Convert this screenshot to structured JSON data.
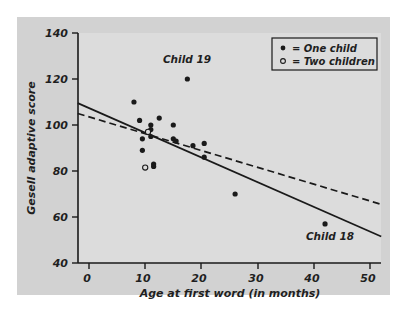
{
  "chart_data": {
    "type": "scatter",
    "title": "",
    "xlabel": "Age at first word (in months)",
    "ylabel": "Gesell adaptive score",
    "xlim": [
      -2,
      52
    ],
    "ylim": [
      40,
      140
    ],
    "xticks": [
      0,
      10,
      20,
      30,
      40,
      50
    ],
    "yticks": [
      40,
      60,
      80,
      100,
      120,
      140
    ],
    "grid": false,
    "legend_position": "top-right",
    "legend": [
      {
        "marker": "filled-dot",
        "label": "= One child"
      },
      {
        "marker": "open-circle",
        "label": "= Two children"
      }
    ],
    "series": [
      {
        "name": "One child",
        "marker": "filled-dot",
        "points": [
          {
            "x": 8,
            "y": 110
          },
          {
            "x": 9,
            "y": 102
          },
          {
            "x": 9.5,
            "y": 94
          },
          {
            "x": 9.5,
            "y": 89
          },
          {
            "x": 11,
            "y": 100
          },
          {
            "x": 11,
            "y": 98
          },
          {
            "x": 11,
            "y": 95
          },
          {
            "x": 11.5,
            "y": 83
          },
          {
            "x": 11.5,
            "y": 82
          },
          {
            "x": 12.5,
            "y": 103
          },
          {
            "x": 15,
            "y": 100
          },
          {
            "x": 15,
            "y": 94
          },
          {
            "x": 15.5,
            "y": 93
          },
          {
            "x": 17.5,
            "y": 120
          },
          {
            "x": 18.5,
            "y": 91
          },
          {
            "x": 20.5,
            "y": 92
          },
          {
            "x": 20.5,
            "y": 86
          },
          {
            "x": 26,
            "y": 70
          },
          {
            "x": 42,
            "y": 57
          }
        ]
      },
      {
        "name": "Two children",
        "marker": "open-circle",
        "points": [
          {
            "x": 10.5,
            "y": 97
          },
          {
            "x": 10,
            "y": 81.5
          }
        ]
      }
    ],
    "lines": [
      {
        "name": "fit-all-data",
        "style": "solid",
        "x0": -2,
        "y0": 109.5,
        "x1": 52,
        "y1": 51.5
      },
      {
        "name": "fit-excluding-outliers",
        "style": "dashed",
        "x0": -2,
        "y0": 105,
        "x1": 52,
        "y1": 65.5
      }
    ],
    "annotations": [
      {
        "text": "Child 19",
        "x": 17.5,
        "y": 126
      },
      {
        "text": "Child 18",
        "x": 42,
        "y": 51
      }
    ]
  },
  "colors": {
    "panel": "#d2d2d2",
    "plot_background": "#dcdcdc",
    "ink": "#1a1a1a",
    "page": "#ffffff"
  }
}
